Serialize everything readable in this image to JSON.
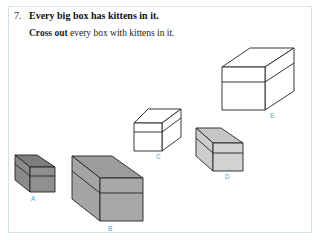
{
  "question": {
    "number": "7.",
    "statement": "Every big box has kittens in it.",
    "instruction_bold": "Cross out",
    "instruction_rest": " every box with kittens in it."
  },
  "boxes": [
    {
      "label": "A",
      "size": "small",
      "fill": "#8a8a8a"
    },
    {
      "label": "B",
      "size": "big",
      "fill": "#a8a8a8"
    },
    {
      "label": "C",
      "size": "small",
      "fill": "#ffffff"
    },
    {
      "label": "D",
      "size": "small",
      "fill": "#cfcfcf"
    },
    {
      "label": "E",
      "size": "big",
      "fill": "#ffffff"
    }
  ],
  "colors": {
    "label": "#4a9fd8",
    "border": "#cfe2ea"
  }
}
